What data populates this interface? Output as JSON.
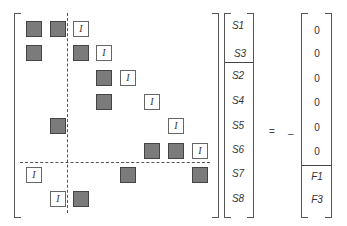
{
  "matrix": {
    "size": 8,
    "cells": [
      {
        "row": 1,
        "col": 1,
        "type": "dark"
      },
      {
        "row": 1,
        "col": 2,
        "type": "dark"
      },
      {
        "row": 1,
        "col": 3,
        "type": "identity",
        "label": "I"
      },
      {
        "row": 2,
        "col": 1,
        "type": "dark"
      },
      {
        "row": 2,
        "col": 3,
        "type": "dark"
      },
      {
        "row": 2,
        "col": 4,
        "type": "identity",
        "label": "I"
      },
      {
        "row": 3,
        "col": 4,
        "type": "dark"
      },
      {
        "row": 3,
        "col": 5,
        "type": "identity",
        "label": "I"
      },
      {
        "row": 4,
        "col": 4,
        "type": "dark"
      },
      {
        "row": 4,
        "col": 6,
        "type": "identity",
        "label": "I"
      },
      {
        "row": 5,
        "col": 2,
        "type": "dark"
      },
      {
        "row": 5,
        "col": 7,
        "type": "identity",
        "label": "I"
      },
      {
        "row": 6,
        "col": 6,
        "type": "dark"
      },
      {
        "row": 6,
        "col": 7,
        "type": "dark"
      },
      {
        "row": 6,
        "col": 8,
        "type": "identity",
        "label": "I"
      },
      {
        "row": 7,
        "col": 1,
        "type": "identity",
        "label": "I"
      },
      {
        "row": 7,
        "col": 5,
        "type": "dark"
      },
      {
        "row": 7,
        "col": 8,
        "type": "dark"
      },
      {
        "row": 8,
        "col": 2,
        "type": "identity",
        "label": "I"
      },
      {
        "row": 8,
        "col": 3,
        "type": "dark"
      }
    ],
    "partition": {
      "vertical_after_col": 2,
      "horizontal_after_row": 6
    }
  },
  "unknown_vector": {
    "entries": [
      "S1",
      "S3",
      "S2",
      "S4",
      "S5",
      "S6",
      "S7",
      "S8"
    ],
    "partition_after_index": 2
  },
  "operator": "=",
  "sign": "–",
  "rhs_vector": {
    "entries": [
      "0",
      "0",
      "0",
      "0",
      "0",
      "0",
      "F1",
      "F3"
    ],
    "partition_after_index": 6
  }
}
